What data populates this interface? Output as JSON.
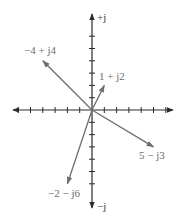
{
  "diagram": {
    "type": "complex-plane-phasors",
    "axes": {
      "positive_imag_label": "+j",
      "negative_imag_label": "−j",
      "origin": [
        92,
        110
      ],
      "unit_px": 12.3,
      "ticks_per_side": 6
    },
    "colors": {
      "axis": "#2a2a2a",
      "vector": "#6e6e6e",
      "label": "#6b6b6b"
    },
    "vectors": [
      {
        "label": "−4 + j4",
        "re": -4,
        "im": 4
      },
      {
        "label": "1 + j2",
        "re": 1,
        "im": 2
      },
      {
        "label": "5 − j3",
        "re": 5,
        "im": -3
      },
      {
        "label": "−2 − j6",
        "re": -2,
        "im": -6
      }
    ]
  }
}
